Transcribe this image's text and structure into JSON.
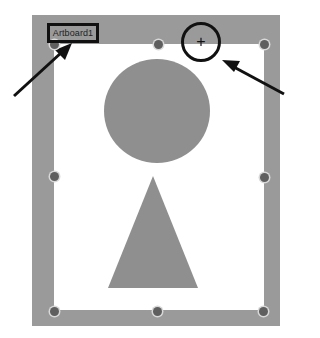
{
  "artboard": {
    "name": "Artboard1",
    "frame_color": "#9a9a9a",
    "canvas_color": "#ffffff",
    "shape_color": "#8f8f8f"
  },
  "annotations": {
    "cursor_glyph": "+",
    "callout_label": "Artboard1"
  },
  "shapes": [
    {
      "type": "circle"
    },
    {
      "type": "triangle"
    }
  ],
  "handles": [
    "top-left",
    "top-center",
    "top-right",
    "middle-left",
    "middle-right",
    "bottom-left",
    "bottom-center",
    "bottom-right"
  ]
}
